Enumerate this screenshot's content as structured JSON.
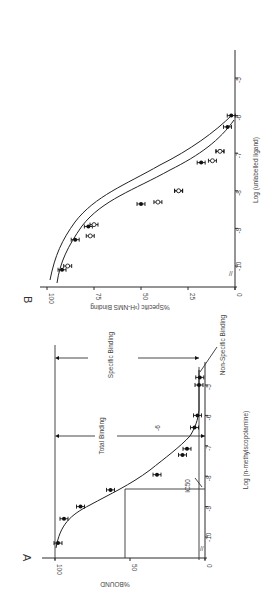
{
  "chart_data": [
    {
      "panel": "A",
      "type": "scatter",
      "xlabel": "Log (n-methylscopolamine)",
      "ylabel": "%BOUND",
      "xlim": [
        -10.5,
        -4.5
      ],
      "ylim": [
        0,
        100
      ],
      "x_ticks": [
        -10,
        -9,
        -8,
        -7,
        -6,
        -5
      ],
      "y_ticks": [
        0,
        50,
        100
      ],
      "annotations": [
        "Total Binding",
        "Specific Binding",
        "Non-Specific Binding",
        "IC50",
        "-6"
      ],
      "reference_lines": {
        "total_binding": 100,
        "non_specific_binding": 4,
        "ic50_log": -8.3,
        "ic50_percent": 52
      },
      "series": [
        {
          "name": "n-methylscopolamine",
          "marker": "filled-circle",
          "x": [
            -10.2,
            -9.4,
            -9.0,
            -8.45,
            -7.95,
            -7.3,
            -7.1,
            -6.4,
            -6.0,
            -5.0,
            -4.75
          ],
          "y": [
            98,
            94,
            83,
            63,
            32,
            15,
            12,
            7,
            5,
            4,
            3.5
          ]
        }
      ]
    },
    {
      "panel": "B",
      "type": "scatter",
      "xlabel": "Log (unlabelled ligand)",
      "ylabel": "%Specific (³H-NMS Binding",
      "xlim": [
        -10.5,
        -4.5
      ],
      "ylim": [
        0,
        100
      ],
      "x_ticks": [
        -10,
        -9,
        -8,
        -7,
        -6,
        -5
      ],
      "y_ticks": [
        0,
        25,
        50,
        75,
        100
      ],
      "series": [
        {
          "name": "filled circles",
          "marker": "filled-circle",
          "x": [
            -10.1,
            -9.3,
            -8.95,
            -8.35,
            -8.0,
            -7.25,
            -6.95,
            -6.3,
            -6.0
          ],
          "y": [
            92,
            85,
            78,
            50,
            30,
            18,
            8,
            4,
            2
          ]
        },
        {
          "name": "open circles",
          "marker": "open-circle",
          "x": [
            -10.0,
            -9.2,
            -8.9,
            -8.3,
            -8.0,
            -7.2,
            -6.95
          ],
          "y": [
            89,
            77,
            75,
            41,
            30,
            12,
            8
          ]
        }
      ]
    }
  ],
  "labels": {
    "panel_a": "A",
    "panel_b": "B",
    "a_ylabel": "%BOUND",
    "a_xlabel": "Log (n-methylscopolamine)",
    "a_total": "Total Binding",
    "a_specific": "Specific Binding",
    "a_nonspecific": "Non-Specific Binding",
    "a_ic50": "IC50",
    "a_minus6": "-6",
    "b_ylabel": "%Specific (³H-NMS Binding",
    "b_xlabel": "Log (unlabelled ligand)"
  }
}
